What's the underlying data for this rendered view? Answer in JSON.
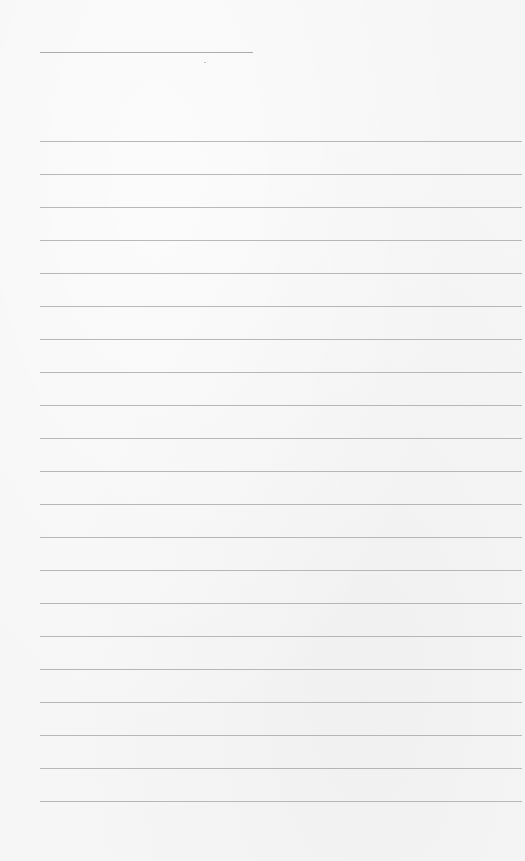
{
  "page": {
    "type": "lined-paper",
    "background_color": "#f6f6f6",
    "line_color": "#ababab"
  },
  "title_line": {
    "left": 40,
    "top": 52,
    "width": 213
  },
  "ruled_lines": {
    "left": 40,
    "right_edge": 522,
    "first_top": 141,
    "spacing": 33,
    "count": 21,
    "tops": [
      141,
      174,
      207,
      240,
      273,
      306,
      339,
      372,
      405,
      438,
      471,
      504,
      537,
      570,
      603,
      636,
      669,
      702,
      735,
      768,
      801
    ]
  }
}
